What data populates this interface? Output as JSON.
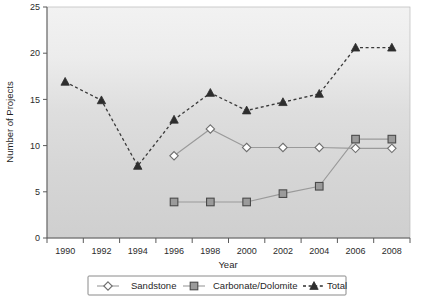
{
  "chart_data": {
    "type": "line",
    "title": "",
    "xlabel": "Year",
    "ylabel": "Number of Projects",
    "categories": [
      1990,
      1992,
      1994,
      1996,
      1998,
      2000,
      2002,
      2004,
      2006,
      2008
    ],
    "xtick_labels": [
      "1990",
      "1992",
      "1994",
      "1996",
      "1998",
      "2000",
      "2002",
      "2004",
      "2006",
      "2008"
    ],
    "ytick_labels": [
      "0",
      "5",
      "10",
      "15",
      "20",
      "25"
    ],
    "ylim": [
      0,
      25
    ],
    "ytick_step": 5,
    "grid": false,
    "legend_position": "bottom",
    "series": [
      {
        "name": "Sandstone",
        "marker": "diamond",
        "line_style": "solid",
        "color": "#9a9a9a",
        "values": [
          null,
          null,
          null,
          8.9,
          11.8,
          9.8,
          9.8,
          9.8,
          9.7,
          9.7
        ]
      },
      {
        "name": "Carbonate/Dolomite",
        "marker": "square",
        "line_style": "solid",
        "color": "#9b9b9b",
        "values": [
          null,
          null,
          null,
          3.9,
          3.9,
          3.9,
          4.8,
          5.6,
          10.7,
          10.7
        ]
      },
      {
        "name": "Total",
        "marker": "triangle",
        "line_style": "dashed",
        "color": "#2e2e2e",
        "values": [
          16.9,
          14.9,
          7.8,
          12.8,
          15.7,
          13.8,
          14.7,
          15.6,
          20.6,
          20.6
        ]
      }
    ]
  },
  "legend": {
    "items": [
      {
        "label": "Sandstone",
        "marker": "diamond-marker"
      },
      {
        "label": "Carbonate/Dolomite",
        "marker": "square-marker"
      },
      {
        "label": "Total",
        "marker": "triangle-marker"
      }
    ]
  },
  "axes": {
    "x_title": "Year",
    "y_title": "Number of Projects"
  }
}
